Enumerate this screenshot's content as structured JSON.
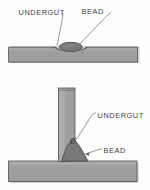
{
  "figure": {
    "background_color": "#fdfdfc",
    "diagrams": [
      {
        "id": "butt-weld",
        "description": "Flat plate with surface weld bead and undercut at both toes",
        "labels": [
          {
            "key": "undercut",
            "text": "UNDERGUT"
          },
          {
            "key": "bead",
            "text": "BEAD"
          }
        ]
      },
      {
        "id": "tee-fillet-weld",
        "description": "Tee joint with fillet weld bead and undercut at vertical member",
        "labels": [
          {
            "key": "undercut",
            "text": "UNDERGUT"
          },
          {
            "key": "bead",
            "text": "BEAD"
          }
        ]
      }
    ]
  },
  "labels": {
    "top_undercut": "UNDERGUT",
    "top_bead": "BEAD",
    "bottom_undercut": "UNDERGUT",
    "bottom_bead": "BEAD"
  },
  "colors": {
    "plate_fill": "#9e9e9e",
    "plate_fill_light": "#ababab",
    "plate_edge": "#5a5a5a",
    "bead_fill": "#787878",
    "bead_edge": "#4c4c4c",
    "leader_line": "#6b6b6b",
    "text": "#434343",
    "background": "#fdfdfc",
    "shadow": "#c8c8c8"
  }
}
